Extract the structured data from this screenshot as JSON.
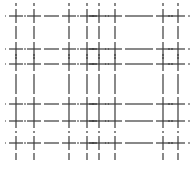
{
  "figure": {
    "width": 196,
    "height": 176,
    "background": "#ffffff",
    "line_color": "#3a3a3a",
    "line_width": 1.2,
    "vertical_lines_x": [
      16,
      34,
      69,
      87,
      99,
      115,
      163,
      178
    ],
    "horizontal_lines_y": [
      16,
      49,
      64,
      104,
      121,
      143
    ],
    "vertical_extent": [
      3,
      160
    ],
    "horizontal_extent": [
      5,
      190
    ],
    "cross_arm": 7,
    "gap": 3
  }
}
